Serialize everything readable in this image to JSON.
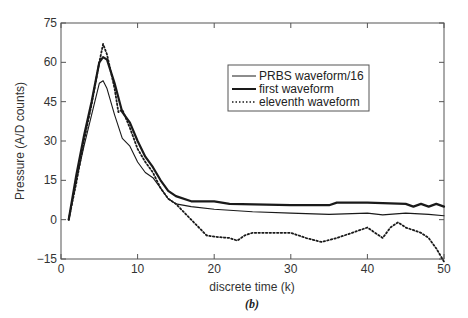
{
  "chart_data": {
    "type": "line",
    "title": "",
    "caption": "(b)",
    "xlabel": "discrete time (k)",
    "ylabel": "Pressure (A/D counts)",
    "xlim": [
      0,
      50
    ],
    "ylim": [
      -15,
      75
    ],
    "xticks": [
      0,
      10,
      20,
      30,
      40,
      50
    ],
    "yticks": [
      -15,
      0,
      15,
      30,
      45,
      60,
      75
    ],
    "grid": false,
    "legend_position": "upper right (inside)",
    "series": [
      {
        "name": "PRBS waveform/16",
        "style": "thin-solid",
        "x": [
          1,
          2,
          3,
          4,
          5,
          5.5,
          6,
          7,
          8,
          9,
          10,
          11,
          12,
          13,
          14,
          15,
          17,
          20,
          25,
          30,
          35,
          40,
          42,
          45,
          48,
          50
        ],
        "y": [
          0,
          15,
          28,
          40,
          52,
          53,
          50,
          40,
          31,
          28,
          22,
          18,
          16,
          12,
          8,
          6,
          5,
          4,
          3,
          2.5,
          2,
          2.5,
          1.8,
          2.5,
          2,
          1.5
        ]
      },
      {
        "name": "first waveform",
        "style": "thick-solid",
        "x": [
          1,
          2,
          3,
          4,
          5,
          5.5,
          6,
          7,
          8,
          9,
          10,
          11,
          12,
          13,
          14,
          15,
          17,
          20,
          22,
          30,
          35,
          36,
          40,
          45,
          46,
          47,
          48,
          49,
          50
        ],
        "y": [
          0,
          17,
          32,
          45,
          60,
          62,
          61,
          52,
          41,
          37,
          30,
          24,
          20,
          15,
          11,
          9,
          7,
          7,
          6,
          5.5,
          5.5,
          6.5,
          6.5,
          6,
          5,
          6,
          5,
          6,
          5
        ]
      },
      {
        "name": "eleventh waveform",
        "style": "dotted",
        "x": [
          1,
          2,
          3,
          4,
          5,
          5.5,
          6,
          7,
          7.5,
          8,
          9,
          10,
          11,
          12,
          13,
          14,
          15,
          16,
          17,
          18,
          19,
          20,
          22,
          23,
          24,
          25,
          28,
          30,
          32,
          34,
          36,
          38,
          40,
          41,
          42,
          43,
          44,
          45,
          47,
          48,
          49,
          50
        ],
        "y": [
          0,
          14,
          30,
          44,
          60,
          67,
          63,
          50,
          41,
          42,
          35,
          27,
          22,
          18,
          12,
          8,
          6,
          3,
          0,
          -3,
          -6,
          -6.5,
          -7,
          -8,
          -6,
          -5,
          -5,
          -5,
          -7,
          -8.5,
          -7,
          -5,
          -3,
          -5,
          -7,
          -3,
          -1,
          -3,
          -5,
          -7,
          -11,
          -16
        ]
      }
    ]
  },
  "plot_area": {
    "left": 61,
    "right": 444,
    "top": 23,
    "bottom": 259
  },
  "colors": {
    "axis": "#555555",
    "line": "#1a1a1a",
    "background": "#ffffff"
  }
}
